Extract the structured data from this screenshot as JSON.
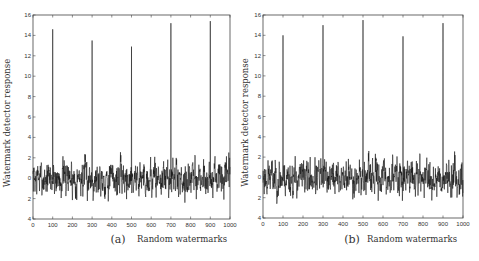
{
  "chart_data": [
    {
      "type": "line",
      "panel": "(a)",
      "xlabel": "Random watermarks",
      "ylabel": "Watermark detector response",
      "xlim": [
        0,
        1000
      ],
      "ylim": [
        -4,
        16
      ],
      "xticks": [
        0,
        100,
        200,
        300,
        400,
        500,
        600,
        700,
        800,
        900,
        1000
      ],
      "yticks": [
        -4,
        -2,
        0,
        2,
        4,
        6,
        8,
        10,
        12,
        14,
        16
      ],
      "ytick_labels": [
        "4",
        "2",
        "0",
        "2",
        "4",
        "6",
        "8",
        "10",
        "12",
        "14",
        "16"
      ],
      "grid": false,
      "noise_range": [
        -2.8,
        2.8
      ],
      "noise_seed": 7,
      "spikes": [
        {
          "x": 100,
          "y": 14.6
        },
        {
          "x": 300,
          "y": 13.5
        },
        {
          "x": 500,
          "y": 12.9
        },
        {
          "x": 700,
          "y": 15.2
        },
        {
          "x": 900,
          "y": 15.4
        }
      ]
    },
    {
      "type": "line",
      "panel": "(b)",
      "xlabel": "Random watermarks",
      "ylabel": "Watermark detector response",
      "xlim": [
        0,
        1000
      ],
      "ylim": [
        -4,
        16
      ],
      "xticks": [
        0,
        100,
        200,
        300,
        400,
        500,
        600,
        700,
        800,
        900,
        1000
      ],
      "yticks": [
        -4,
        -2,
        0,
        2,
        4,
        6,
        8,
        10,
        12,
        14,
        16
      ],
      "ytick_labels": [
        "4",
        "2",
        "0",
        "2",
        "4",
        "6",
        "8",
        "10",
        "12",
        "14",
        "16"
      ],
      "grid": false,
      "noise_range": [
        -2.8,
        2.8
      ],
      "noise_seed": 23,
      "spikes": [
        {
          "x": 100,
          "y": 14.0
        },
        {
          "x": 300,
          "y": 15.0
        },
        {
          "x": 500,
          "y": 15.5
        },
        {
          "x": 700,
          "y": 13.9
        },
        {
          "x": 900,
          "y": 15.2
        }
      ]
    }
  ],
  "layout": {
    "panels": [
      {
        "left": 33,
        "top": 15,
        "right": 230,
        "bottom": 219,
        "ylabel_x": 10,
        "panel_label_x": 118,
        "xlabel_x": 182
      },
      {
        "left": 263,
        "top": 15,
        "right": 463,
        "bottom": 218,
        "ylabel_x": 248,
        "panel_label_x": 352,
        "xlabel_x": 412
      }
    ],
    "label_row_y": 243,
    "line_color": "#111111",
    "axis_color": "#444444"
  }
}
